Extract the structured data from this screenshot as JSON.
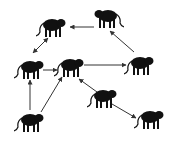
{
  "diagram": {
    "type": "directed-graph",
    "node_icon": "monkey-silhouette-icon",
    "colors": {
      "node": "#111111",
      "edge": "#333333",
      "background": "#ffffff"
    },
    "nodes": [
      {
        "id": "A",
        "x": 52,
        "y": 26,
        "facing": "right"
      },
      {
        "id": "B",
        "x": 108,
        "y": 17,
        "facing": "left"
      },
      {
        "id": "C",
        "x": 30,
        "y": 68,
        "facing": "right"
      },
      {
        "id": "D",
        "x": 70,
        "y": 66,
        "facing": "right"
      },
      {
        "id": "E",
        "x": 140,
        "y": 64,
        "facing": "right"
      },
      {
        "id": "F",
        "x": 30,
        "y": 121,
        "facing": "right"
      },
      {
        "id": "G",
        "x": 103,
        "y": 97,
        "facing": "right"
      },
      {
        "id": "H",
        "x": 150,
        "y": 118,
        "facing": "right"
      }
    ],
    "edges": [
      {
        "from": "B",
        "to": "A",
        "x1": 94,
        "y1": 27,
        "x2": 70,
        "y2": 27,
        "double": false
      },
      {
        "from": "A",
        "to": "C",
        "x1": 48,
        "y1": 38,
        "x2": 33,
        "y2": 53,
        "double": true
      },
      {
        "from": "C",
        "to": "D",
        "x1": 43,
        "y1": 70,
        "x2": 57,
        "y2": 70,
        "double": false
      },
      {
        "from": "D",
        "to": "E",
        "x1": 84,
        "y1": 65,
        "x2": 126,
        "y2": 65,
        "double": false
      },
      {
        "from": "E",
        "to": "B",
        "x1": 134,
        "y1": 52,
        "x2": 110,
        "y2": 31,
        "double": false
      },
      {
        "from": "F",
        "to": "C",
        "x1": 30,
        "y1": 110,
        "x2": 30,
        "y2": 80,
        "double": false
      },
      {
        "from": "F",
        "to": "D",
        "x1": 41,
        "y1": 112,
        "x2": 62,
        "y2": 77,
        "double": false
      },
      {
        "from": "G",
        "to": "D",
        "x1": 97,
        "y1": 92,
        "x2": 79,
        "y2": 79,
        "double": false
      },
      {
        "from": "G",
        "to": "H",
        "x1": 112,
        "y1": 104,
        "x2": 136,
        "y2": 118,
        "double": false
      }
    ]
  }
}
